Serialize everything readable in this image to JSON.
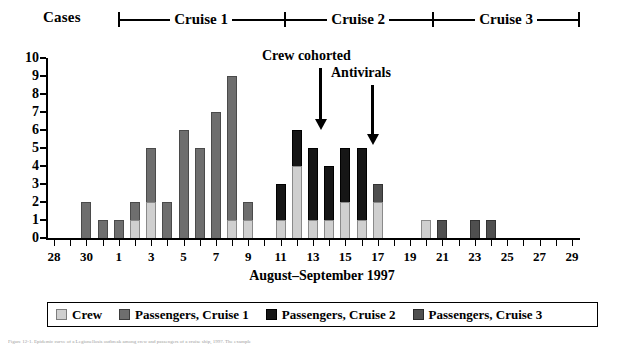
{
  "header": {
    "cases_label": "Cases",
    "cruises": [
      {
        "label": "Cruise 1",
        "left_pct": 0.0,
        "width_pct": 36.0
      },
      {
        "label": "Cruise 2",
        "left_pct": 36.0,
        "width_pct": 32.0
      },
      {
        "label": "Cruise 3",
        "left_pct": 68.0,
        "width_pct": 32.0
      }
    ]
  },
  "annotations": [
    {
      "name": "crew-cohorted",
      "text": "Crew cohorted",
      "text_left": 262,
      "text_top": 48,
      "arrow_left": 319,
      "arrow_top": 68,
      "arrow_height": 52
    },
    {
      "name": "antivirals",
      "text": "Antivirals",
      "text_left": 331,
      "text_top": 65,
      "arrow_left": 371,
      "arrow_top": 85,
      "arrow_height": 50
    }
  ],
  "axes": {
    "x_title": "August–September 1997",
    "y_ticks": [
      0,
      1,
      2,
      3,
      4,
      5,
      6,
      7,
      8,
      9,
      10
    ],
    "x_tick_labels": [
      "28",
      "",
      "30",
      "",
      "1",
      "",
      "3",
      "",
      "5",
      "",
      "7",
      "",
      "9",
      "",
      "11",
      "",
      "13",
      "",
      "15",
      "",
      "17",
      "",
      "19",
      "",
      "21",
      "",
      "23",
      "",
      "25",
      "",
      "27",
      "",
      "29"
    ]
  },
  "legend": {
    "items": [
      {
        "key": "crew",
        "label": "Crew",
        "color": "#cfcfcf"
      },
      {
        "key": "c1",
        "label": "Passengers, Cruise 1",
        "color": "#6e6e6e"
      },
      {
        "key": "c2",
        "label": "Passengers, Cruise 2",
        "color": "#161616"
      },
      {
        "key": "c3",
        "label": "Passengers, Cruise 3",
        "color": "#4f4f4f"
      }
    ]
  },
  "caption": {
    "text": "Figure 12-1. Epidemic curve of a Legionellosis outbreak among crew and passengers of a cruise ship, 1997. The example"
  },
  "chart_data": {
    "type": "bar",
    "title": "",
    "subtitle": "",
    "xlabel": "August–September 1997",
    "ylabel": "Cases",
    "ylim": [
      0,
      10
    ],
    "grid": false,
    "stacked": true,
    "legend_position": "bottom",
    "categories": [
      "28",
      "29",
      "30",
      "31",
      "1",
      "2",
      "3",
      "4",
      "5",
      "6",
      "7",
      "8",
      "9",
      "10",
      "11",
      "12",
      "13",
      "14",
      "15",
      "16",
      "17",
      "18",
      "19",
      "20",
      "21",
      "22",
      "23",
      "24",
      "25",
      "26",
      "27",
      "28",
      "29"
    ],
    "series": [
      {
        "name": "Crew",
        "color": "#cfcfcf",
        "values": [
          0,
          0,
          0,
          0,
          0,
          1,
          2,
          0,
          0,
          0,
          0,
          1,
          1,
          0,
          1,
          4,
          1,
          1,
          2,
          1,
          2,
          0,
          0,
          1,
          0,
          0,
          0,
          0,
          0,
          0,
          0,
          0,
          0
        ]
      },
      {
        "name": "Passengers, Cruise 1",
        "color": "#6e6e6e",
        "values": [
          0,
          0,
          2,
          1,
          1,
          1,
          3,
          2,
          6,
          5,
          7,
          8,
          1,
          0,
          0,
          0,
          0,
          0,
          0,
          0,
          0,
          0,
          0,
          0,
          0,
          0,
          0,
          0,
          0,
          0,
          0,
          0,
          0
        ]
      },
      {
        "name": "Passengers, Cruise 2",
        "color": "#161616",
        "values": [
          0,
          0,
          0,
          0,
          0,
          0,
          0,
          0,
          0,
          0,
          0,
          0,
          0,
          0,
          2,
          2,
          4,
          3,
          3,
          4,
          0,
          0,
          0,
          0,
          0,
          0,
          0,
          0,
          0,
          0,
          0,
          0,
          0
        ]
      },
      {
        "name": "Passengers, Cruise 3",
        "color": "#4f4f4f",
        "values": [
          0,
          0,
          0,
          0,
          0,
          0,
          0,
          0,
          0,
          0,
          0,
          0,
          0,
          0,
          0,
          0,
          0,
          0,
          0,
          0,
          1,
          0,
          0,
          0,
          1,
          0,
          1,
          1,
          0,
          0,
          0,
          0,
          0
        ]
      }
    ],
    "totals": [
      0,
      0,
      2,
      1,
      1,
      2,
      5,
      2,
      6,
      5,
      7,
      9,
      2,
      0,
      3,
      6,
      5,
      4,
      5,
      5,
      3,
      0,
      0,
      1,
      1,
      0,
      1,
      1,
      0,
      0,
      0,
      0,
      0
    ],
    "annotations": [
      {
        "text": "Crew cohorted",
        "at_category": "12"
      },
      {
        "text": "Antivirals",
        "at_category": "15"
      }
    ]
  }
}
